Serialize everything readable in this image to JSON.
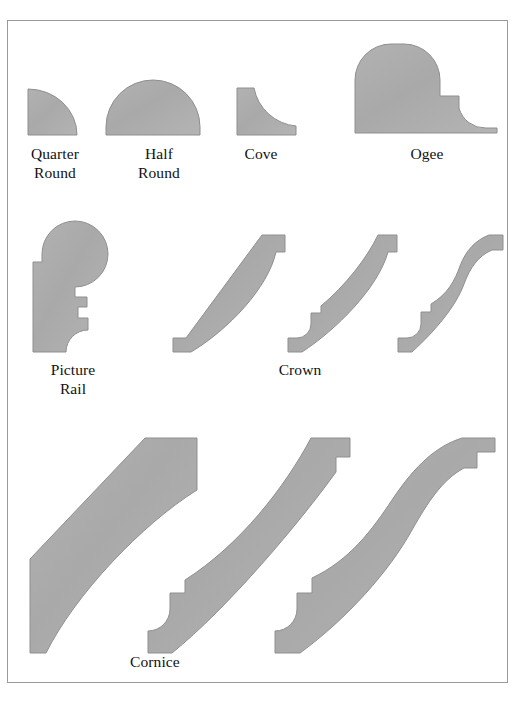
{
  "figure": {
    "background_color": "#ffffff",
    "border_color": "#9a9a9a",
    "shape_fill_color": "#adadad",
    "shape_stroke_color": "#8f8f8f",
    "text_color": "#111111"
  },
  "captions": {
    "quarter_round": "Quarter\nRound",
    "half_round": "Half\nRound",
    "cove": "Cove",
    "ogee": "Ogee",
    "picture_rail": "Picture\nRail",
    "crown": "Crown",
    "cornice": "Cornice"
  },
  "rows": [
    {
      "name": "row-1-basic-profiles",
      "shapes": [
        {
          "name": "quarter-round-profile",
          "label": "Quarter Round"
        },
        {
          "name": "half-round-profile",
          "label": "Half Round"
        },
        {
          "name": "cove-profile",
          "label": "Cove"
        },
        {
          "name": "ogee-profile",
          "label": "Ogee"
        }
      ]
    },
    {
      "name": "row-2-rail-and-crown",
      "shapes": [
        {
          "name": "picture-rail-profile",
          "label": "Picture Rail"
        },
        {
          "name": "crown-profile-1",
          "label": "Crown"
        },
        {
          "name": "crown-profile-2",
          "label": "Crown"
        },
        {
          "name": "crown-profile-3",
          "label": "Crown"
        }
      ]
    },
    {
      "name": "row-3-cornice",
      "shapes": [
        {
          "name": "cornice-profile-1",
          "label": "Cornice"
        },
        {
          "name": "cornice-profile-2",
          "label": "Cornice"
        },
        {
          "name": "cornice-profile-3",
          "label": "Cornice"
        }
      ]
    }
  ]
}
